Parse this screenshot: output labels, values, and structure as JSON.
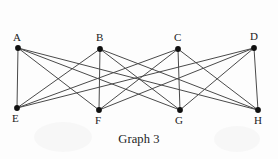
{
  "figure": {
    "caption": "Graph 3",
    "stroke_color": "#4a4a4a",
    "node_color": "#101010",
    "background_color": "#fdfdfd",
    "width": 278,
    "height": 159
  },
  "graph": {
    "type": "undirected-simple-graph",
    "description": "complete bipartite graph K4,4",
    "vertex_count": 8,
    "edge_count": 16,
    "nodes": [
      {
        "id": "A",
        "label": "A",
        "x": 18,
        "y": 48,
        "label_x": 13,
        "label_y": 32,
        "part": "top"
      },
      {
        "id": "B",
        "label": "B",
        "x": 100,
        "y": 49,
        "label_x": 96,
        "label_y": 32,
        "part": "top"
      },
      {
        "id": "C",
        "label": "C",
        "x": 178,
        "y": 49,
        "label_x": 174,
        "label_y": 32,
        "part": "top"
      },
      {
        "id": "D",
        "label": "D",
        "x": 254,
        "y": 48,
        "label_x": 250,
        "label_y": 31,
        "part": "top"
      },
      {
        "id": "E",
        "label": "E",
        "x": 17,
        "y": 108,
        "label_x": 12,
        "label_y": 113,
        "part": "bottom"
      },
      {
        "id": "F",
        "label": "F",
        "x": 99,
        "y": 110,
        "label_x": 95,
        "label_y": 115,
        "part": "bottom"
      },
      {
        "id": "G",
        "label": "G",
        "x": 180,
        "y": 110,
        "label_x": 175,
        "label_y": 115,
        "part": "bottom"
      },
      {
        "id": "H",
        "label": "H",
        "x": 258,
        "y": 110,
        "label_x": 254,
        "label_y": 115,
        "part": "bottom"
      }
    ],
    "edges": [
      {
        "from": "A",
        "to": "E"
      },
      {
        "from": "A",
        "to": "F"
      },
      {
        "from": "A",
        "to": "G"
      },
      {
        "from": "A",
        "to": "H"
      },
      {
        "from": "B",
        "to": "E"
      },
      {
        "from": "B",
        "to": "F"
      },
      {
        "from": "B",
        "to": "G"
      },
      {
        "from": "B",
        "to": "H"
      },
      {
        "from": "C",
        "to": "E"
      },
      {
        "from": "C",
        "to": "F"
      },
      {
        "from": "C",
        "to": "G"
      },
      {
        "from": "C",
        "to": "H"
      },
      {
        "from": "D",
        "to": "E"
      },
      {
        "from": "D",
        "to": "F"
      },
      {
        "from": "D",
        "to": "G"
      },
      {
        "from": "D",
        "to": "H"
      }
    ]
  }
}
